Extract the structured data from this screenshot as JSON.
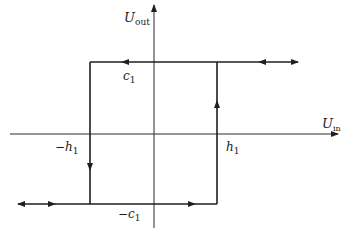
{
  "diagram": {
    "type": "hysteresis-loop",
    "axes": {
      "y_label": "U",
      "y_label_sub": "out",
      "x_label": "U",
      "x_label_sub": "in"
    },
    "labels": {
      "c1": {
        "main": "c",
        "sub": "1"
      },
      "neg_c1": {
        "prefix": "−",
        "main": "c",
        "sub": "1"
      },
      "h1": {
        "main": "h",
        "sub": "1"
      },
      "neg_h1": {
        "prefix": "−",
        "main": "h",
        "sub": "1"
      }
    },
    "colors": {
      "line": "#1f1f1f",
      "axis": "#2a2a2a",
      "background": "#ffffff"
    }
  }
}
